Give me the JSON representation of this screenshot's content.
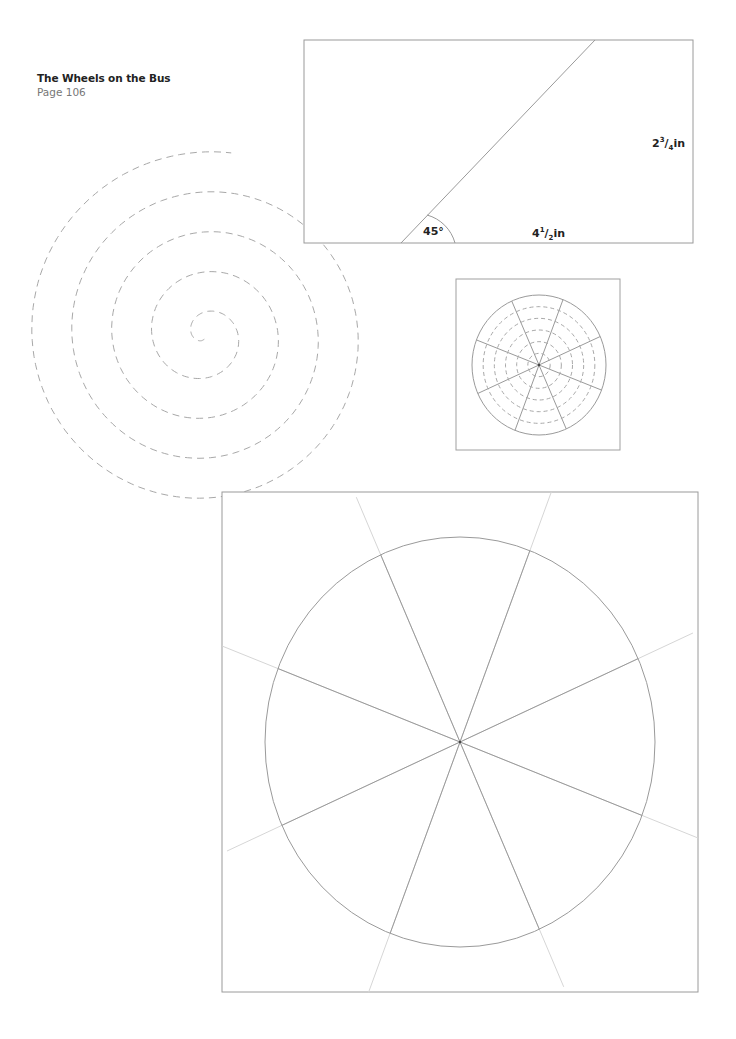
{
  "header": {
    "title": "The Wheels on the Bus",
    "page": "Page 106"
  },
  "bus_template": {
    "angle_label": "45°",
    "width_whole": "4",
    "width_num": "1",
    "width_den": "2",
    "width_unit": "in",
    "height_whole": "2",
    "height_num": "3",
    "height_den": "4",
    "height_unit": "in"
  },
  "spiral": {
    "style": "dashed",
    "turns": 4.5
  },
  "small_wheel": {
    "spokes": 8,
    "dashed_rings": 5
  },
  "large_wheel": {
    "spokes": 8
  },
  "colors": {
    "line": "#9a9a9a",
    "light_line": "#d6d6d6",
    "dash": "#a8a8a8",
    "text": "#222222"
  }
}
